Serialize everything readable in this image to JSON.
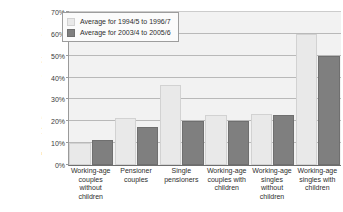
{
  "chart_data": {
    "type": "bar",
    "title": "",
    "xlabel": "",
    "ylabel": "For each family type, proportion of the population in households below 60% of median income after deducting housing costs",
    "ylim": [
      0,
      70
    ],
    "ytick_labels": [
      "0%",
      "10%",
      "20%",
      "30%",
      "40%",
      "50%",
      "60%",
      "70%"
    ],
    "ytick_values": [
      0,
      10,
      20,
      30,
      40,
      50,
      60,
      70
    ],
    "grid": true,
    "legend_position": "top-left-inside",
    "categories": [
      "Working-age couples without children",
      "Pensioner couples",
      "Single pensioners",
      "Working-age couples with children",
      "Working-age singles without children",
      "Working-age singles with children"
    ],
    "series": [
      {
        "name": "Average for 1994/5 to 1996/7",
        "color": "#e9e9e9",
        "values": [
          10,
          21.5,
          36.5,
          23,
          23.5,
          60
        ]
      },
      {
        "name": "Average for 2003/4 to 2005/6",
        "color": "#7f7f7f",
        "values": [
          11.5,
          17.5,
          20,
          20,
          23,
          50
        ]
      }
    ]
  },
  "legend": {
    "entries": [
      {
        "label": "Average for 1994/5 to 1996/7"
      },
      {
        "label": "Average for 2003/4 to 2005/6"
      }
    ]
  }
}
